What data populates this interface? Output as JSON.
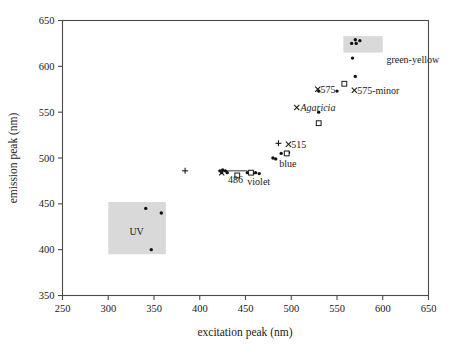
{
  "chart_data": {
    "type": "scatter",
    "title": "",
    "xlabel": "excitation peak (nm)",
    "ylabel": "emission peak (nm)",
    "xlim": [
      250,
      650
    ],
    "ylim": [
      350,
      650
    ],
    "xticks": [
      250,
      300,
      350,
      400,
      450,
      500,
      550,
      600,
      650
    ],
    "yticks": [
      350,
      400,
      450,
      500,
      550,
      600,
      650
    ],
    "grid": false,
    "legend": "none",
    "series": [
      {
        "name": "filled-circle",
        "marker": "filled-circle",
        "points": [
          [
            341,
            445
          ],
          [
            358,
            440
          ],
          [
            347,
            400
          ],
          [
            422,
            486
          ],
          [
            425,
            487
          ],
          [
            428,
            486
          ],
          [
            424,
            484
          ],
          [
            430,
            484
          ],
          [
            452,
            484
          ],
          [
            456,
            484
          ],
          [
            458,
            483
          ],
          [
            461,
            484
          ],
          [
            465,
            483
          ],
          [
            480,
            500
          ],
          [
            483,
            499
          ],
          [
            489,
            505
          ],
          [
            494,
            506
          ],
          [
            497,
            506
          ],
          [
            530,
            550
          ],
          [
            530,
            573
          ],
          [
            550,
            573
          ],
          [
            570,
            589
          ],
          [
            567,
            609
          ],
          [
            566,
            625
          ],
          [
            571,
            625
          ],
          [
            570,
            629
          ],
          [
            575,
            628
          ]
        ]
      },
      {
        "name": "open-square",
        "marker": "open-square",
        "points": [
          [
            441,
            481
          ],
          [
            456,
            484
          ],
          [
            495,
            505
          ],
          [
            530,
            538
          ],
          [
            558,
            581
          ]
        ]
      },
      {
        "name": "cross-x",
        "marker": "x",
        "points": [
          [
            424,
            484
          ],
          [
            497,
            515
          ],
          [
            529,
            575
          ],
          [
            506,
            555
          ],
          [
            569,
            574
          ]
        ]
      },
      {
        "name": "plus",
        "marker": "plus",
        "points": [
          [
            384,
            486
          ],
          [
            486,
            516
          ]
        ]
      }
    ],
    "regions": [
      {
        "label": "UV",
        "x0": 300,
        "x1": 363,
        "y0": 395,
        "y1": 452,
        "label_x": 331,
        "label_y": 420
      },
      {
        "label": "green-yellow",
        "x0": 557,
        "x1": 600,
        "y0": 615,
        "y1": 633,
        "label_x": 604,
        "label_y": 608
      }
    ],
    "annotations": [
      {
        "text": "486",
        "x": 431,
        "y": 477,
        "style": "normal"
      },
      {
        "text": "violet",
        "x": 452,
        "y": 474,
        "style": "normal"
      },
      {
        "text": "blue",
        "x": 487,
        "y": 494,
        "style": "normal"
      },
      {
        "text": "515",
        "x": 500,
        "y": 515,
        "style": "normal"
      },
      {
        "text": "575",
        "x": 532,
        "y": 575,
        "style": "normal"
      },
      {
        "text": "Agaricia",
        "x": 510,
        "y": 555,
        "style": "italic"
      },
      {
        "text": "575-minor",
        "x": 572,
        "y": 574,
        "style": "normal"
      },
      {
        "text": "green-yellow",
        "x": 604,
        "y": 607,
        "style": "normal"
      }
    ],
    "connectors": [
      {
        "x0": 424,
        "y0": 486,
        "x1": 452,
        "y1": 486
      }
    ]
  },
  "axes": {
    "x_title": "excitation peak (nm)",
    "y_title": "emission peak (nm)",
    "x_tick_labels": [
      "250",
      "300",
      "350",
      "400",
      "450",
      "500",
      "550",
      "600",
      "650"
    ],
    "y_tick_labels": [
      "350",
      "400",
      "450",
      "500",
      "550",
      "600",
      "650"
    ]
  },
  "colors": {
    "marker": "#111111",
    "frame": "#4a4a4a",
    "shade": "#d9d9d9",
    "background": "#ffffff"
  }
}
